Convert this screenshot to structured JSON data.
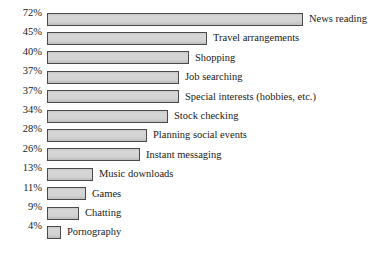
{
  "chart_data": {
    "type": "bar",
    "orientation": "horizontal",
    "title": "",
    "subtitle": "",
    "xlabel": "",
    "ylabel": "",
    "xlim": [
      0,
      75
    ],
    "grid": false,
    "legend": "none",
    "value_suffix": "%",
    "bar_fill_color": "#d2d2d2",
    "bar_border_color": "#4a4a4a",
    "background_color": "#ffffff",
    "text_color": "#1a1a1a",
    "px_per_percent": 3.56,
    "categories": [
      "News reading",
      "Travel arrangements",
      "Shopping",
      "Job searching",
      "Special interests (hobbies, etc.)",
      "Stock checking",
      "Planning social events",
      "Instant messaging",
      "Music downloads",
      "Games",
      "Chatting",
      "Pornography"
    ],
    "values": [
      72,
      45,
      40,
      37,
      37,
      34,
      28,
      26,
      13,
      11,
      9,
      4
    ],
    "value_labels": [
      "72%",
      "45%",
      "40%",
      "37%",
      "37%",
      "34%",
      "28%",
      "26%",
      "13%",
      "11%",
      "9%",
      "4%"
    ]
  },
  "rows": [
    {
      "pct": "72%",
      "label": "News reading",
      "value": 72
    },
    {
      "pct": "45%",
      "label": "Travel arrangements",
      "value": 45
    },
    {
      "pct": "40%",
      "label": "Shopping",
      "value": 40
    },
    {
      "pct": "37%",
      "label": "Job searching",
      "value": 37
    },
    {
      "pct": "37%",
      "label": "Special interests (hobbies, etc.)",
      "value": 37
    },
    {
      "pct": "34%",
      "label": "Stock checking",
      "value": 34
    },
    {
      "pct": "28%",
      "label": "Planning social events",
      "value": 28
    },
    {
      "pct": "26%",
      "label": "Instant messaging",
      "value": 26
    },
    {
      "pct": "13%",
      "label": "Music downloads",
      "value": 13
    },
    {
      "pct": "11%",
      "label": "Games",
      "value": 11
    },
    {
      "pct": "9%",
      "label": "Chatting",
      "value": 9
    },
    {
      "pct": "4%",
      "label": "Pornography",
      "value": 4
    }
  ]
}
